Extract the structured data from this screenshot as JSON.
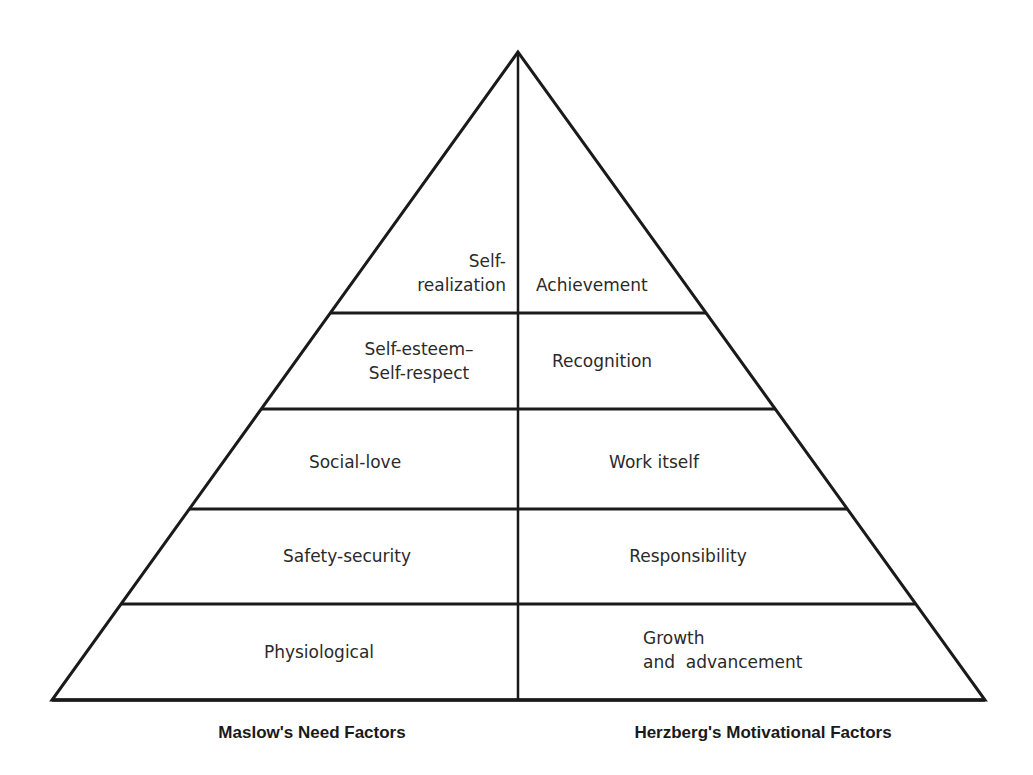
{
  "diagram": {
    "type": "pyramid",
    "apex": [
      518,
      52
    ],
    "base_y": 700,
    "base_left_x": 52,
    "base_right_x": 985,
    "divider_ys": [
      313,
      409,
      509,
      604
    ],
    "line_color": "#1a1a1a",
    "levels": [
      {
        "left": [
          "Self-",
          "realization"
        ],
        "right": [
          "Achievement"
        ]
      },
      {
        "left": [
          "Self-esteem–",
          "Self-respect"
        ],
        "right": [
          "Recognition"
        ]
      },
      {
        "left": [
          "Social-love"
        ],
        "right": [
          "Work itself"
        ]
      },
      {
        "left": [
          "Safety-security"
        ],
        "right": [
          "Responsibility"
        ]
      },
      {
        "left": [
          "Physiological"
        ],
        "right": [
          "Growth",
          "and  advancement"
        ]
      }
    ],
    "captions": {
      "left": "Maslow's Need Factors",
      "right": "Herzberg's Motivational Factors"
    }
  }
}
